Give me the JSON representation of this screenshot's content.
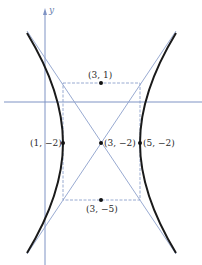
{
  "diagram": {
    "type": "hyperbola",
    "equation_form": "(x-3)^2/4 - (y+2)^2/9 = 1",
    "axes": {
      "y_label": "y",
      "x_label": ""
    },
    "points": [
      {
        "name": "top-covertex",
        "coords": [
          3,
          1
        ],
        "label": "(3, 1)"
      },
      {
        "name": "left-vertex",
        "coords": [
          1,
          -2
        ],
        "label": "(1, −2)"
      },
      {
        "name": "center",
        "coords": [
          3,
          -2
        ],
        "label": "(3, −2)"
      },
      {
        "name": "right-vertex",
        "coords": [
          5,
          -2
        ],
        "label": "(5, −2)"
      },
      {
        "name": "bottom-covertex",
        "coords": [
          3,
          -5
        ],
        "label": "(3, −5)"
      }
    ],
    "colors": {
      "axis": "#7f93c4",
      "asymptote": "#8da0cc",
      "rectangle": "#8da0cc",
      "hyperbola": "#1a1a1a",
      "point": "#111111",
      "text": "#2b2b2b"
    }
  }
}
